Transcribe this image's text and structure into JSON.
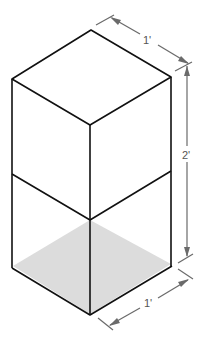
{
  "diagram": {
    "dimensions": {
      "top_width_label": "1'",
      "height_label": "2'",
      "bottom_width_label": "1'"
    },
    "colors": {
      "edge": "#111111",
      "dimension": "#6a6a6a",
      "floor_fill": "#dcdcdc",
      "background": "#ffffff"
    }
  }
}
